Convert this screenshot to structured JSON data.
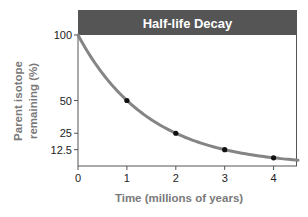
{
  "chart_data": {
    "type": "line",
    "title": "Half-life Decay",
    "xlabel": "Time (millions of years)",
    "ylabel": "Parent isotope remaining (%)",
    "ylabel_lines": [
      "Parent isotope",
      "remaining (%)"
    ],
    "xlim": [
      0,
      4.5
    ],
    "ylim": [
      0,
      100
    ],
    "x_ticks": [
      0,
      1,
      2,
      3,
      4
    ],
    "x_tick_labels": [
      "0",
      "1",
      "2",
      "3",
      "4"
    ],
    "y_ticks": [
      100,
      50,
      25,
      12.5
    ],
    "y_tick_labels": [
      "100",
      "50",
      "25",
      "12.5"
    ],
    "grid": false,
    "legend": null,
    "series": [
      {
        "name": "Parent isotope remaining",
        "curve": "exponential decay, half-life = 1 million years",
        "x": [
          0,
          0.5,
          1,
          1.5,
          2,
          2.5,
          3,
          3.5,
          4,
          4.5
        ],
        "values": [
          100,
          70.7,
          50,
          35.4,
          25,
          17.7,
          12.5,
          8.8,
          6.25,
          4.4
        ]
      }
    ],
    "markers": {
      "x": [
        1,
        2,
        3,
        4
      ],
      "values": [
        50,
        25,
        12.5,
        6.25
      ]
    }
  },
  "colors": {
    "title_bar": "#555555",
    "title_text": "#ffffff",
    "curve": "#858585",
    "marker": "#111111",
    "axis": "#555555",
    "axis_label": "#7a7a7a",
    "tick_label": "#222222"
  }
}
